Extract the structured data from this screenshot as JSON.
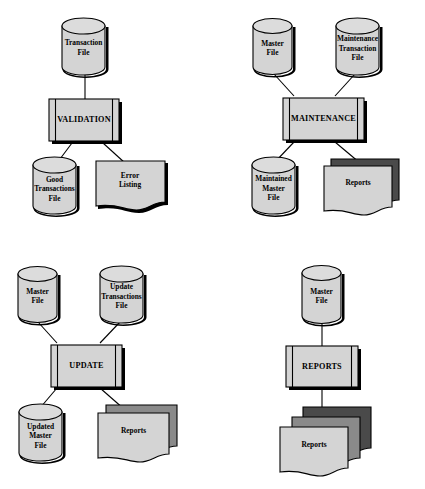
{
  "diagram": {
    "colors": {
      "background": "#ffffff",
      "shape_light": "#d4d4d4",
      "shape_cylinder_top": "#dcdcdc",
      "shape_mid_gray": "#8a8a8a",
      "shape_dark_gray": "#4a4a4a",
      "outline": "#000000"
    },
    "panels": [
      {
        "id": "validation",
        "name": "validation-flowchart",
        "process": {
          "label": "VALIDATION",
          "symbol": "process-box"
        },
        "inputs": [
          {
            "label": "Transaction\nFile",
            "line1": "Transaction",
            "line2": "File",
            "symbol": "cylinder-file"
          }
        ],
        "outputs": [
          {
            "label": "Good Transactions File",
            "line1": "Good",
            "line2": "Transactions",
            "line3": "File",
            "symbol": "cylinder-file"
          },
          {
            "label": "Error Listing",
            "line1": "Error",
            "line2": "Listing",
            "symbol": "document"
          }
        ]
      },
      {
        "id": "maintenance",
        "name": "maintenance-flowchart",
        "process": {
          "label": "MAINTENANCE",
          "symbol": "process-box"
        },
        "inputs": [
          {
            "label": "Master File",
            "line1": "Master",
            "line2": "File",
            "symbol": "cylinder-file"
          },
          {
            "label": "Maintenance Transaction File",
            "line1": "Maintenance",
            "line2": "Transaction",
            "line3": "File",
            "symbol": "cylinder-file"
          }
        ],
        "outputs": [
          {
            "label": "Maintained Master File",
            "line1": "Maintained",
            "line2": "Master",
            "line3": "File",
            "symbol": "cylinder-file"
          },
          {
            "label": "Reports",
            "line1": "Reports",
            "symbol": "multi-document",
            "layers": 2
          }
        ]
      },
      {
        "id": "update",
        "name": "update-flowchart",
        "process": {
          "label": "UPDATE",
          "symbol": "process-box"
        },
        "inputs": [
          {
            "label": "Master File",
            "line1": "Master",
            "line2": "File",
            "symbol": "cylinder-file"
          },
          {
            "label": "Update Transactions File",
            "line1": "Update",
            "line2": "Transactions",
            "line3": "File",
            "symbol": "cylinder-file"
          }
        ],
        "outputs": [
          {
            "label": "Updated Master File",
            "line1": "Updated",
            "line2": "Master",
            "line3": "File",
            "symbol": "cylinder-file"
          },
          {
            "label": "Reports",
            "line1": "Reports",
            "symbol": "multi-document",
            "layers": 2
          }
        ]
      },
      {
        "id": "reports",
        "name": "reports-flowchart",
        "process": {
          "label": "REPORTS",
          "symbol": "process-box"
        },
        "inputs": [
          {
            "label": "Master File",
            "line1": "Master",
            "line2": "File",
            "symbol": "cylinder-file"
          }
        ],
        "outputs": [
          {
            "label": "Reports",
            "line1": "Reports",
            "symbol": "multi-document",
            "layers": 3
          }
        ]
      }
    ]
  }
}
